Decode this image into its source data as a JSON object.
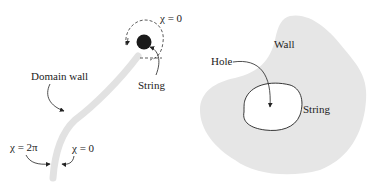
{
  "left_panel": {
    "labels": {
      "chi_top": "χ = 0",
      "string": "String",
      "domain_wall": "Domain wall",
      "chi_2pi": "χ = 2π",
      "chi_bottom": "χ = 0"
    }
  },
  "right_panel": {
    "labels": {
      "wall": "Wall",
      "hole": "Hole",
      "string": "String"
    }
  },
  "colors": {
    "wall_fill": "#e6e6e6",
    "string_fill": "#1a1a1a",
    "line": "#222222"
  }
}
